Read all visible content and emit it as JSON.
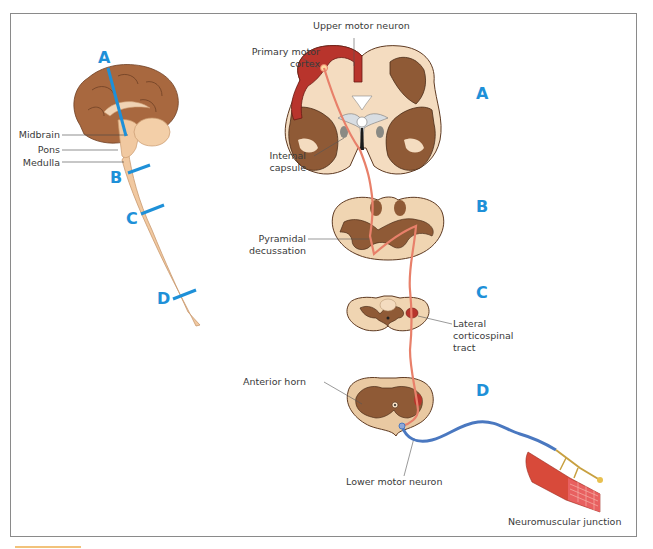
{
  "figure": {
    "accent_color": "#1e90d8",
    "tract_color": "#e8806a",
    "lower_neuron_color": "#4a78c0"
  },
  "sagittal_view": {
    "labels": {
      "midbrain": "Midbrain",
      "pons": "Pons",
      "medulla": "Medulla"
    },
    "section_markers": [
      "A",
      "B",
      "C",
      "D"
    ]
  },
  "sections": {
    "A": {
      "letter": "A",
      "level": "Cerebrum (coronal section)"
    },
    "B": {
      "letter": "B",
      "level": "Medulla"
    },
    "C": {
      "letter": "C",
      "level": "Cervical spinal cord"
    },
    "D": {
      "letter": "D",
      "level": "Lumbar spinal cord"
    }
  },
  "annotations": {
    "upper_motor_neuron": "Upper motor neuron",
    "primary_motor_cortex_1": "Primary motor",
    "primary_motor_cortex_2": "cortex",
    "internal_capsule_1": "Internal",
    "internal_capsule_2": "capsule",
    "pyramidal_decussation_1": "Pyramidal",
    "pyramidal_decussation_2": "decussation",
    "lateral_cst_1": "Lateral",
    "lateral_cst_2": "corticospinal",
    "lateral_cst_3": "tract",
    "anterior_horn": "Anterior horn",
    "lower_motor_neuron": "Lower motor neuron",
    "neuromuscular_junction": "Neuromuscular junction"
  }
}
